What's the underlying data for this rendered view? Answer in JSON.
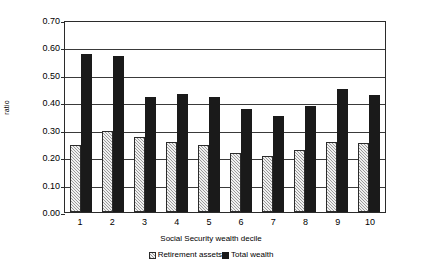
{
  "chart_data": {
    "type": "bar",
    "title": "",
    "xlabel": "Social Security wealth decile",
    "ylabel": "ratio",
    "categories": [
      "1",
      "2",
      "3",
      "4",
      "5",
      "6",
      "7",
      "8",
      "9",
      "10"
    ],
    "series": [
      {
        "name": "Retirement assets",
        "color": "#9a9a9a",
        "pattern": "checkered",
        "values": [
          0.245,
          0.295,
          0.275,
          0.255,
          0.245,
          0.215,
          0.205,
          0.225,
          0.255,
          0.25
        ]
      },
      {
        "name": "Total wealth",
        "color": "#1a1a1a",
        "pattern": "solid",
        "values": [
          0.575,
          0.57,
          0.42,
          0.43,
          0.42,
          0.375,
          0.35,
          0.385,
          0.45,
          0.425
        ]
      }
    ],
    "ylim": [
      0.0,
      0.7
    ],
    "ytick_labels": [
      "0.70",
      "0.60",
      "0.50",
      "0.40",
      "0.30",
      "0.20",
      "0.10",
      "0.00"
    ],
    "ytick_values": [
      0.7,
      0.6,
      0.5,
      0.4,
      0.3,
      0.2,
      0.1,
      0.0
    ],
    "grid": true,
    "grid_axis": "y",
    "legend_position": "bottom"
  }
}
